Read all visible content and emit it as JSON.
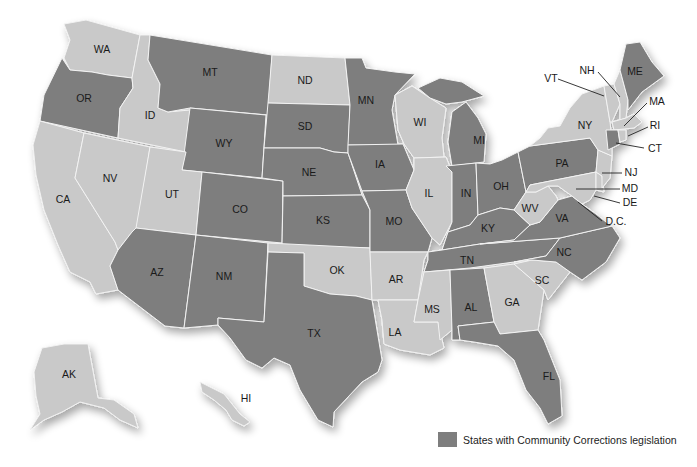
{
  "colors": {
    "with_legislation": "#7e7e7e",
    "without_legislation": "#c9c9c9",
    "border": "#f2f2f2",
    "label": "#1a1a1a"
  },
  "legend": {
    "label": "States with Community Corrections legislation"
  },
  "states": {
    "WA": {
      "label": "WA",
      "legislation": false
    },
    "OR": {
      "label": "OR",
      "legislation": true
    },
    "CA": {
      "label": "CA",
      "legislation": false
    },
    "ID": {
      "label": "ID",
      "legislation": false
    },
    "NV": {
      "label": "NV",
      "legislation": false
    },
    "MT": {
      "label": "MT",
      "legislation": true
    },
    "WY": {
      "label": "WY",
      "legislation": true
    },
    "UT": {
      "label": "UT",
      "legislation": false
    },
    "AZ": {
      "label": "AZ",
      "legislation": true
    },
    "CO": {
      "label": "CO",
      "legislation": true
    },
    "NM": {
      "label": "NM",
      "legislation": true
    },
    "ND": {
      "label": "ND",
      "legislation": false
    },
    "SD": {
      "label": "SD",
      "legislation": true
    },
    "NE": {
      "label": "NE",
      "legislation": true
    },
    "KS": {
      "label": "KS",
      "legislation": true
    },
    "OK": {
      "label": "OK",
      "legislation": false
    },
    "TX": {
      "label": "TX",
      "legislation": true
    },
    "MN": {
      "label": "MN",
      "legislation": true
    },
    "IA": {
      "label": "IA",
      "legislation": true
    },
    "MO": {
      "label": "MO",
      "legislation": true
    },
    "AR": {
      "label": "AR",
      "legislation": false
    },
    "LA": {
      "label": "LA",
      "legislation": false
    },
    "WI": {
      "label": "WI",
      "legislation": false
    },
    "IL": {
      "label": "IL",
      "legislation": false
    },
    "MI": {
      "label": "MI",
      "legislation": true
    },
    "IN": {
      "label": "IN",
      "legislation": true
    },
    "OH": {
      "label": "OH",
      "legislation": true
    },
    "KY": {
      "label": "KY",
      "legislation": true
    },
    "TN": {
      "label": "TN",
      "legislation": true
    },
    "MS": {
      "label": "MS",
      "legislation": false
    },
    "AL": {
      "label": "AL",
      "legislation": true
    },
    "GA": {
      "label": "GA",
      "legislation": false
    },
    "FL": {
      "label": "FL",
      "legislation": true
    },
    "SC": {
      "label": "SC",
      "legislation": false
    },
    "NC": {
      "label": "NC",
      "legislation": true
    },
    "VA": {
      "label": "VA",
      "legislation": true
    },
    "WV": {
      "label": "WV",
      "legislation": false
    },
    "PA": {
      "label": "PA",
      "legislation": true
    },
    "NY": {
      "label": "NY",
      "legislation": false
    },
    "VT": {
      "label": "VT",
      "legislation": false
    },
    "NH": {
      "label": "NH",
      "legislation": false
    },
    "ME": {
      "label": "ME",
      "legislation": true
    },
    "MA": {
      "label": "MA",
      "legislation": false
    },
    "RI": {
      "label": "RI",
      "legislation": false
    },
    "CT": {
      "label": "CT",
      "legislation": true
    },
    "NJ": {
      "label": "NJ",
      "legislation": false
    },
    "DE": {
      "label": "DE",
      "legislation": false
    },
    "MD": {
      "label": "MD",
      "legislation": false
    },
    "DC": {
      "label": "D.C.",
      "legislation": false
    },
    "AK": {
      "label": "AK",
      "legislation": false
    },
    "HI": {
      "label": "HI",
      "legislation": false
    }
  }
}
